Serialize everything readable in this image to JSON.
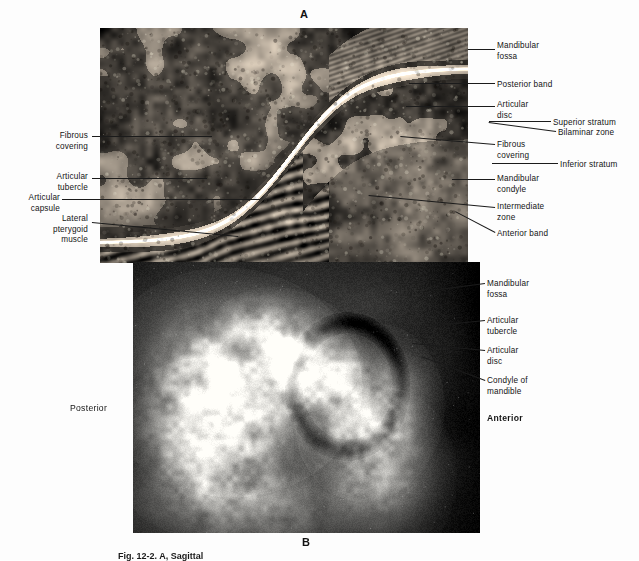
{
  "figure": {
    "panel_a_letter": "A",
    "panel_b_letter": "B",
    "caption": "Fig. 12-2. A, Sagittal"
  },
  "panel_a": {
    "name": "histologic-sagittal-section-tmj",
    "labels_left": [
      {
        "id": "fibrous-covering-left",
        "text": "Fibrous\ncovering"
      },
      {
        "id": "articular-tubercle-left",
        "text": "Articular\ntubercle"
      },
      {
        "id": "articular-capsule",
        "text": "Articular\ncapsule"
      },
      {
        "id": "lateral-pterygoid-muscle",
        "text": "Lateral\npterygoid\nmuscle"
      }
    ],
    "labels_right": [
      {
        "id": "mandibular-fossa",
        "text": "Mandibular\nfossa"
      },
      {
        "id": "posterior-band",
        "text": "Posterior band"
      },
      {
        "id": "articular-disc",
        "text": "Articular\ndisc"
      },
      {
        "id": "superior-stratum",
        "text": "Superior stratum"
      },
      {
        "id": "bilaminar-zone",
        "text": "Bilaminar zone"
      },
      {
        "id": "fibrous-covering-right",
        "text": "Fibrous\ncovering"
      },
      {
        "id": "inferior-stratum",
        "text": "Inferior stratum"
      },
      {
        "id": "mandibular-condyle",
        "text": "Mandibular\ncondyle"
      },
      {
        "id": "intermediate-zone",
        "text": "Intermediate\nzone"
      },
      {
        "id": "anterior-band",
        "text": "Anterior band"
      }
    ]
  },
  "panel_b": {
    "name": "radiograph-tmj",
    "orientation_left": "Posterior",
    "orientation_right": "Anterior",
    "labels_right": [
      {
        "id": "mandibular-fossa-b",
        "text": "Mandibular\nfossa"
      },
      {
        "id": "articular-tubercle-b",
        "text": "Articular\ntubercle"
      },
      {
        "id": "articular-disc-b",
        "text": "Articular\ndisc"
      },
      {
        "id": "condyle-of-mandible-b",
        "text": "Condyle of\nmandible"
      }
    ]
  },
  "colors": {
    "page_background": "#fdfdfd",
    "text": "#141414",
    "leader_line": "#1b1b1b",
    "panel_a_base": "#7d7365",
    "panel_b_base": "#2a2a2a"
  }
}
